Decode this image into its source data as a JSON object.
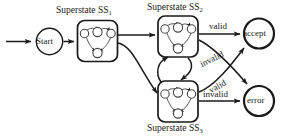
{
  "diagram": {
    "title_hidden": "",
    "nodes": {
      "start": {
        "label": "Start",
        "shape": "circle"
      },
      "accept": {
        "label": "accept",
        "shape": "circle-bold"
      },
      "error": {
        "label": "error",
        "shape": "circle-bold"
      }
    },
    "superstates": [
      {
        "id": "ss1",
        "label": "Superstate SS",
        "subscript": "1"
      },
      {
        "id": "ss2",
        "label": "Superstate SS",
        "subscript": "2"
      },
      {
        "id": "ss3",
        "label": "Superstate SS",
        "subscript": "3"
      }
    ],
    "edge_labels": {
      "ss2_accept": "valid",
      "ss2_error": "invalid",
      "ss3_accept": "valid",
      "ss3_error": "invalid"
    },
    "colors": {
      "stroke": "#1a1a1a",
      "background": "#ffffff",
      "inner_node_fill": "#ffffff"
    }
  }
}
